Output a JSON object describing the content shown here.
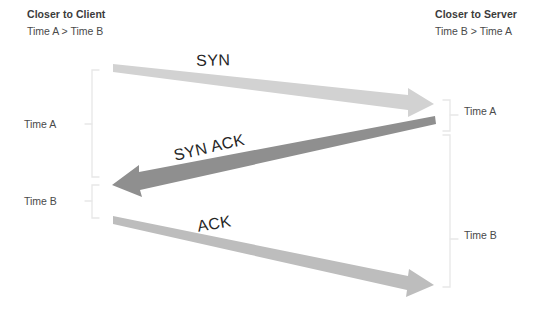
{
  "diagram": {
    "type": "tcp-three-way-handshake-clock-skew",
    "headers": {
      "client": {
        "title": "Closer to Client",
        "subtitle": "Time A > Time B"
      },
      "server": {
        "title": "Closer to Server",
        "subtitle": "Time B > Time A"
      }
    },
    "messages": [
      {
        "id": "syn",
        "label": "SYN",
        "direction": "client-to-server",
        "color": "#d2d2d2"
      },
      {
        "id": "syn-ack",
        "label": "SYN ACK",
        "direction": "server-to-client",
        "color": "#8f8f8f"
      },
      {
        "id": "ack",
        "label": "ACK",
        "direction": "client-to-server",
        "color": "#bdbdbd"
      }
    ],
    "brackets": [
      {
        "id": "left-time-a",
        "label": "Time A",
        "side": "left"
      },
      {
        "id": "left-time-b",
        "label": "Time B",
        "side": "left"
      },
      {
        "id": "right-time-a",
        "label": "Time A",
        "side": "right"
      },
      {
        "id": "right-time-b",
        "label": "Time B",
        "side": "right"
      }
    ],
    "colors": {
      "bracket": "#e8e8e8",
      "text": "#3b3b3b",
      "label_text": "#262626",
      "background": "#ffffff"
    }
  }
}
